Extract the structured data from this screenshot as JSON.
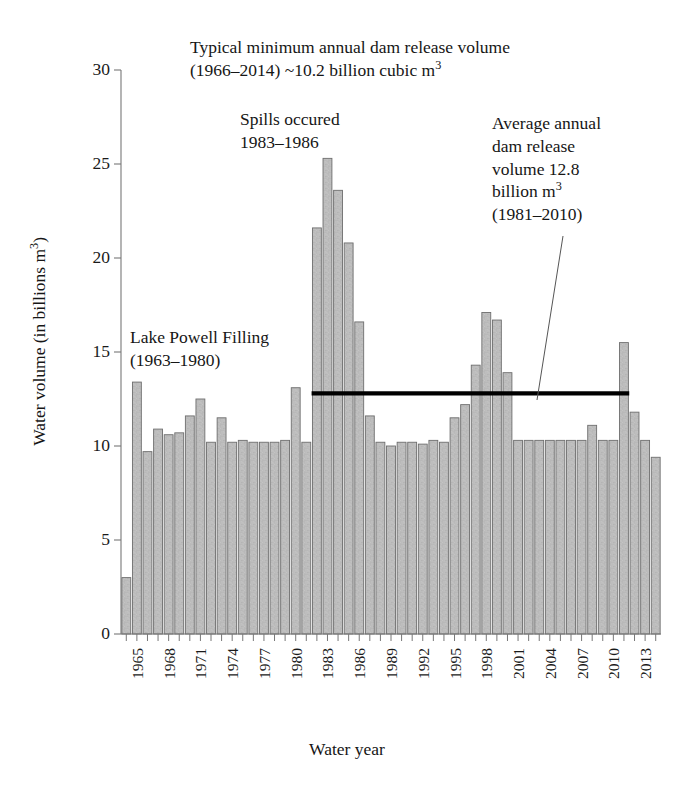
{
  "chart_data": {
    "type": "bar",
    "title": "",
    "xlabel": "Water year",
    "ylabel": "Water volume (in billions m³)",
    "ylim": [
      0,
      30
    ],
    "ytick_values": [
      0,
      5,
      10,
      15,
      20,
      25,
      30
    ],
    "ytick_labels": [
      "0",
      "5",
      "10",
      "15",
      "20",
      "25",
      "30"
    ],
    "xlim": [
      1963.5,
      2014.5
    ],
    "xtick_labels": [
      "1965",
      "1968",
      "1971",
      "1974",
      "1977",
      "1980",
      "1983",
      "1986",
      "1989",
      "1992",
      "1995",
      "1998",
      "2001",
      "2004",
      "2007",
      "2010",
      "2013"
    ],
    "grid": false,
    "legend": "none",
    "bar_color": "#b8b8b8",
    "bar_edge_color": "#6e6e6e",
    "line_color": "#000000",
    "categories": [
      1964,
      1965,
      1966,
      1967,
      1968,
      1969,
      1970,
      1971,
      1972,
      1973,
      1974,
      1975,
      1976,
      1977,
      1978,
      1979,
      1980,
      1981,
      1982,
      1983,
      1984,
      1985,
      1986,
      1987,
      1988,
      1989,
      1990,
      1991,
      1992,
      1993,
      1994,
      1995,
      1996,
      1997,
      1998,
      1999,
      2000,
      2001,
      2002,
      2003,
      2004,
      2005,
      2006,
      2007,
      2008,
      2009,
      2010,
      2011,
      2012,
      2013,
      2014
    ],
    "values": [
      3.0,
      13.4,
      9.7,
      10.9,
      10.6,
      10.7,
      11.6,
      12.5,
      10.2,
      11.5,
      10.2,
      10.3,
      10.2,
      10.2,
      10.2,
      10.3,
      13.1,
      10.2,
      21.6,
      25.3,
      23.6,
      20.8,
      16.6,
      11.6,
      10.2,
      10.0,
      10.2,
      10.2,
      10.1,
      10.3,
      10.2,
      11.5,
      12.2,
      14.3,
      17.1,
      16.7,
      13.9,
      10.3,
      10.3,
      10.3,
      10.3,
      10.3,
      10.3,
      10.3,
      11.1,
      10.3,
      10.3,
      15.5,
      11.8,
      10.3,
      9.4
    ],
    "reference_line": {
      "value": 12.8,
      "label": "Average annual dam release volume 12.8 billion m3 (1981-2010)",
      "x_start_year": 1982,
      "x_end_year": 2011
    },
    "annotations": [
      {
        "id": "typical-minimum",
        "lines": [
          "Typical minimum annual dam release volume",
          "(1966–2014) ~10.2 billion cubic m",
          "3"
        ],
        "line1": "Typical minimum annual dam release volume",
        "line2_prefix": "(1966–2014) ~10.2 billion cubic m",
        "line2_sup": "3"
      },
      {
        "id": "spills-occured",
        "line1": "Spills occured",
        "line2": "1983–1986"
      },
      {
        "id": "average-annual",
        "line1": "Average annual",
        "line2": "dam release",
        "line3": "volume 12.8",
        "line4_prefix": "billion m",
        "line4_sup": "3",
        "line5": "(1981–2010)"
      },
      {
        "id": "lake-powell-filling",
        "line1": "Lake Powell Filling",
        "line2": "(1963–1980)"
      }
    ]
  },
  "annotations": {
    "typical": {
      "line1": "Typical minimum annual dam release volume",
      "line2_prefix": "(1966–2014) ~10.2 billion cubic m",
      "line2_sup": "3"
    },
    "spills": {
      "line1": "Spills occured",
      "line2": "1983–1986"
    },
    "average": {
      "line1": "Average annual",
      "line2": "dam release",
      "line3": "volume 12.8",
      "line4_prefix": "billion m",
      "line4_sup": "3",
      "line5": "(1981–2010)"
    },
    "powell": {
      "line1": "Lake Powell Filling",
      "line2": "(1963–1980)"
    }
  },
  "axes": {
    "y_title_prefix": "Water volume (in billions m",
    "y_title_sup": "3",
    "y_title_suffix": ")",
    "x_title": "Water year"
  }
}
